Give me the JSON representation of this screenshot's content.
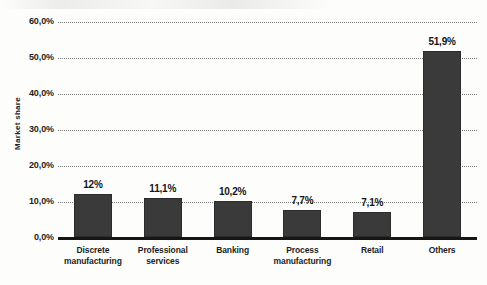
{
  "chart_data": {
    "type": "bar",
    "title": "",
    "subtitle": "",
    "xlabel": "",
    "ylabel": "Market share",
    "ylim": [
      0,
      60
    ],
    "grid": true,
    "legend": false,
    "categories": [
      "Discrete manufacturing",
      "Professional services",
      "Banking",
      "Process manufacturing",
      "Retail",
      "Others"
    ],
    "category_lines": [
      [
        "Discrete",
        "manufacturing"
      ],
      [
        "Professional",
        "services"
      ],
      [
        "Banking",
        ""
      ],
      [
        "Process",
        "manufacturing"
      ],
      [
        "Retail",
        ""
      ],
      [
        "Others",
        ""
      ]
    ],
    "values": [
      12.0,
      11.1,
      10.2,
      7.7,
      7.1,
      51.9
    ],
    "data_labels": [
      "12%",
      "11,1%",
      "10,2%",
      "7,7%",
      "7,1%",
      "51,9%"
    ],
    "ytick_labels": [
      "60,0%",
      "50,0%",
      "40,0%",
      "30,0%",
      "20,0%",
      "10,0%",
      "0,0%"
    ],
    "ytick_values": [
      60,
      50,
      40,
      30,
      20,
      10,
      0
    ],
    "bar_color": "#3a3a3a",
    "gridline_color": "#7c7c7c",
    "axis_color": "#161616"
  }
}
